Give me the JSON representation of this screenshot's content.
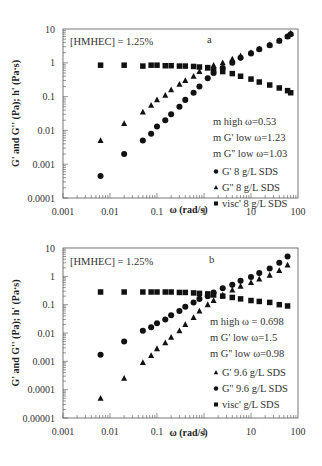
{
  "chart_data": [
    {
      "type": "scatter",
      "panel_label": "a",
      "annotation": "[HMHEC] = 1.25%",
      "xlabel": "ω (rad/s)",
      "ylabel": "G' and G'' (Pa); h' (Pa·s)",
      "xscale": "log",
      "yscale": "log",
      "xlim": [
        0.001,
        100
      ],
      "ylim": [
        0.0001,
        10
      ],
      "xticks": [
        "0.001",
        "0.01",
        "0.1",
        "1",
        "10",
        "100"
      ],
      "yticks": [
        "0.0001",
        "0.001",
        "0.01",
        "0.1",
        "1",
        "10"
      ],
      "fit_text": [
        "m high ω=0.53",
        "m G' low ω=1.23",
        "m G'' low ω=1.03"
      ],
      "legend_position": "lower right",
      "series": [
        {
          "name": "G' 8 g/L SDS",
          "marker": "circle",
          "x": [
            0.0063,
            0.02,
            0.05,
            0.075,
            0.1,
            0.15,
            0.2,
            0.3,
            0.4,
            0.6,
            0.8,
            1.2,
            1.6,
            2.5,
            4,
            6,
            10,
            15,
            25,
            40,
            60,
            70
          ],
          "y": [
            0.00045,
            0.002,
            0.005,
            0.008,
            0.013,
            0.02,
            0.03,
            0.05,
            0.08,
            0.13,
            0.2,
            0.35,
            0.5,
            0.7,
            1.0,
            1.4,
            1.9,
            2.5,
            3.3,
            4.5,
            6.0,
            7.0
          ]
        },
        {
          "name": "G'' 8 g/L SDS",
          "marker": "triangle",
          "x": [
            0.0063,
            0.02,
            0.05,
            0.075,
            0.1,
            0.15,
            0.2,
            0.3,
            0.4,
            0.6,
            0.8,
            1.2,
            1.6,
            2.5,
            4,
            6,
            10,
            15,
            25,
            40,
            60,
            70
          ],
          "y": [
            0.005,
            0.016,
            0.035,
            0.055,
            0.08,
            0.11,
            0.16,
            0.23,
            0.3,
            0.4,
            0.55,
            0.7,
            0.85,
            1.0,
            1.3,
            1.6,
            2.0,
            2.6,
            3.4,
            4.5,
            6.0,
            7.5
          ]
        },
        {
          "name": "visc' 8 g/L SDS",
          "marker": "square",
          "x": [
            0.0063,
            0.02,
            0.05,
            0.075,
            0.1,
            0.15,
            0.2,
            0.3,
            0.4,
            0.6,
            0.8,
            1.2,
            1.6,
            2.5,
            4,
            6,
            10,
            15,
            25,
            40,
            60,
            70
          ],
          "y": [
            0.85,
            0.85,
            0.8,
            0.85,
            0.85,
            0.82,
            0.82,
            0.8,
            0.8,
            0.78,
            0.75,
            0.72,
            0.62,
            0.55,
            0.48,
            0.4,
            0.33,
            0.27,
            0.22,
            0.18,
            0.15,
            0.13
          ]
        }
      ]
    },
    {
      "type": "scatter",
      "panel_label": "b",
      "annotation": "[HMHEC] = 1.25%",
      "xlabel": "ω (rad/s)",
      "ylabel": "G' and G'' (Pa); h' (Pa·s)",
      "xscale": "log",
      "yscale": "log",
      "xlim": [
        0.001,
        100
      ],
      "ylim": [
        1e-05,
        10
      ],
      "xticks": [
        "0.001",
        "0.01",
        "0.1",
        "1",
        "10",
        "100"
      ],
      "yticks": [
        "0.00001",
        "0.0001",
        "0.001",
        "0.01",
        "0.1",
        "1",
        "10"
      ],
      "fit_text": [
        "m high ω = 0.698",
        "m G' low ω=1.5",
        "m G'' low ω=0.98"
      ],
      "legend_position": "lower right",
      "series": [
        {
          "name": "G' 9.6 g/L SDS",
          "marker": "triangle",
          "x": [
            0.0063,
            0.02,
            0.05,
            0.075,
            0.1,
            0.15,
            0.2,
            0.3,
            0.4,
            0.6,
            0.8,
            1.2,
            1.6,
            2.5,
            4,
            6,
            10,
            15,
            25,
            40,
            60
          ],
          "y": [
            5e-05,
            0.00025,
            0.0009,
            0.0016,
            0.0028,
            0.0045,
            0.007,
            0.012,
            0.02,
            0.035,
            0.06,
            0.1,
            0.14,
            0.22,
            0.33,
            0.45,
            0.6,
            0.8,
            1.1,
            1.6,
            2.5
          ]
        },
        {
          "name": "G'' 9.6 g/L SDS",
          "marker": "circle",
          "x": [
            0.0063,
            0.02,
            0.05,
            0.075,
            0.1,
            0.15,
            0.2,
            0.3,
            0.4,
            0.6,
            0.8,
            1.2,
            1.6,
            2.5,
            4,
            6,
            10,
            15,
            25,
            40,
            60
          ],
          "y": [
            0.0017,
            0.005,
            0.012,
            0.016,
            0.022,
            0.03,
            0.042,
            0.06,
            0.085,
            0.12,
            0.16,
            0.2,
            0.27,
            0.38,
            0.5,
            0.7,
            0.95,
            1.3,
            1.9,
            3.0,
            5.0
          ]
        },
        {
          "name": "visc' g/L SDS",
          "marker": "square",
          "x": [
            0.0063,
            0.02,
            0.05,
            0.075,
            0.1,
            0.15,
            0.2,
            0.3,
            0.4,
            0.6,
            0.8,
            1.2,
            1.6,
            2.5,
            4,
            6,
            10,
            15,
            25,
            40,
            60
          ],
          "y": [
            0.28,
            0.28,
            0.28,
            0.28,
            0.28,
            0.28,
            0.28,
            0.27,
            0.27,
            0.26,
            0.25,
            0.24,
            0.22,
            0.2,
            0.18,
            0.16,
            0.14,
            0.13,
            0.12,
            0.1,
            0.09
          ]
        }
      ]
    }
  ]
}
